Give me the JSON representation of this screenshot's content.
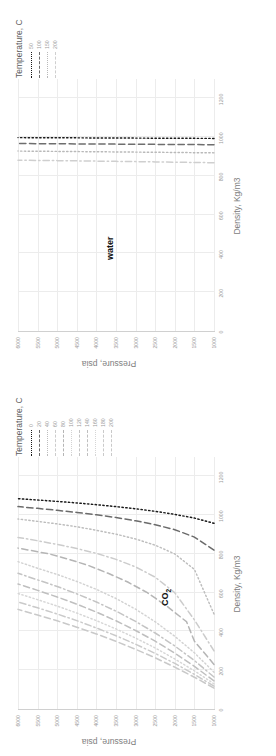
{
  "charts": [
    {
      "id": "water",
      "annotation": "water",
      "legend_title": "Temperature, C",
      "chart_data": {
        "type": "line",
        "title": "water",
        "xlabel": "Density, Kg/m3",
        "ylabel": "Pressure, psia",
        "xlim": [
          0,
          1300
        ],
        "ylim": [
          1000,
          6000
        ],
        "xticks": [
          "0",
          "200",
          "400",
          "600",
          "800",
          "1000",
          "1200"
        ],
        "yticks": [
          "1000",
          "1500",
          "2000",
          "2500",
          "3000",
          "3500",
          "4000",
          "4500",
          "5000",
          "5500",
          "6000"
        ],
        "grid": true,
        "legend_position": "top-right-outside",
        "legend_title": "Temperature, C",
        "series": [
          {
            "name": "50",
            "color": "#1a1a1a",
            "dash": "dotted",
            "points": [
              [
                993.5,
                1000
              ],
              [
                993.9,
                1500
              ],
              [
                994.3,
                2000
              ],
              [
                994.7,
                2500
              ],
              [
                995.1,
                3000
              ],
              [
                995.6,
                3500
              ],
              [
                996.0,
                4000
              ],
              [
                996.4,
                4500
              ],
              [
                996.8,
                5000
              ],
              [
                997.2,
                5500
              ],
              [
                997.6,
                6000
              ]
            ]
          },
          {
            "name": "100",
            "color": "#6e6e6e",
            "dash": "dashed",
            "points": [
              [
                961.0,
                1000
              ],
              [
                961.6,
                1500
              ],
              [
                962.2,
                2000
              ],
              [
                962.8,
                2500
              ],
              [
                963.4,
                3000
              ],
              [
                964.0,
                3500
              ],
              [
                964.6,
                4000
              ],
              [
                965.2,
                4500
              ],
              [
                965.8,
                5000
              ],
              [
                966.4,
                5500
              ],
              [
                967.0,
                6000
              ]
            ]
          },
          {
            "name": "150",
            "color": "#b9b9b9",
            "dash": "dotted",
            "points": [
              [
                919.0,
                1000
              ],
              [
                920.0,
                1500
              ],
              [
                921.0,
                2000
              ],
              [
                922.0,
                2500
              ],
              [
                922.9,
                3000
              ],
              [
                923.8,
                3500
              ],
              [
                924.7,
                4000
              ],
              [
                925.6,
                4500
              ],
              [
                926.5,
                5000
              ],
              [
                927.3,
                5500
              ],
              [
                928.1,
                6000
              ]
            ]
          },
          {
            "name": "200",
            "color": "#cfcfcf",
            "dash": "dashdot",
            "points": [
              [
                868.0,
                1000
              ],
              [
                869.5,
                1500
              ],
              [
                871.0,
                2000
              ],
              [
                872.4,
                2500
              ],
              [
                873.8,
                3000
              ],
              [
                875.1,
                3500
              ],
              [
                876.4,
                4000
              ],
              [
                877.7,
                4500
              ],
              [
                878.9,
                5000
              ],
              [
                880.1,
                5500
              ],
              [
                881.3,
                6000
              ]
            ]
          }
        ]
      }
    },
    {
      "id": "co2",
      "annotation": "CO2",
      "legend_title": "Temperature, C",
      "chart_data": {
        "type": "line",
        "title": "CO2",
        "xlabel": "Density, Kg/m3",
        "ylabel": "Pressure, psia",
        "xlim": [
          0,
          1300
        ],
        "ylim": [
          1000,
          6000
        ],
        "xticks": [
          "0",
          "200",
          "400",
          "600",
          "800",
          "1000",
          "1200"
        ],
        "yticks": [
          "1000",
          "1500",
          "2000",
          "2500",
          "3000",
          "3500",
          "4000",
          "4500",
          "5000",
          "5500",
          "6000"
        ],
        "grid": true,
        "legend_position": "top-right-outside",
        "legend_title": "Temperature, C",
        "series": [
          {
            "name": "0",
            "color": "#1a1a1a",
            "dash": "dotted",
            "points": [
              [
                958,
                1000
              ],
              [
                985,
                1500
              ],
              [
                1004,
                2000
              ],
              [
                1020,
                2500
              ],
              [
                1033,
                3000
              ],
              [
                1044,
                3500
              ],
              [
                1054,
                4000
              ],
              [
                1063,
                4500
              ],
              [
                1071,
                5000
              ],
              [
                1078,
                5500
              ],
              [
                1085,
                6000
              ]
            ]
          },
          {
            "name": "20",
            "color": "#6b6b6b",
            "dash": "dashed",
            "points": [
              [
                820,
                1000
              ],
              [
                887,
                1500
              ],
              [
                925,
                2000
              ],
              [
                951,
                2500
              ],
              [
                971,
                3000
              ],
              [
                988,
                3500
              ],
              [
                1002,
                4000
              ],
              [
                1014,
                4500
              ],
              [
                1025,
                5000
              ],
              [
                1035,
                5500
              ],
              [
                1044,
                6000
              ]
            ]
          },
          {
            "name": "40",
            "color": "#bdbdbd",
            "dash": "dotted",
            "points": [
              [
                490,
                1000
              ],
              [
                720,
                1500
              ],
              [
                800,
                2000
              ],
              [
                845,
                2500
              ],
              [
                877,
                3000
              ],
              [
                902,
                3500
              ],
              [
                922,
                4000
              ],
              [
                940,
                4500
              ],
              [
                955,
                5000
              ],
              [
                968,
                5500
              ],
              [
                980,
                6000
              ]
            ]
          },
          {
            "name": "60",
            "color": "#cccccc",
            "dash": "dashdot",
            "points": [
              [
                300,
                1000
              ],
              [
                460,
                1500
              ],
              [
                600,
                2000
              ],
              [
                680,
                2500
              ],
              [
                733,
                3000
              ],
              [
                772,
                3500
              ],
              [
                803,
                4000
              ],
              [
                828,
                4500
              ],
              [
                849,
                5000
              ],
              [
                868,
                5500
              ],
              [
                885,
                6000
              ]
            ]
          },
          {
            "name": "80",
            "color": "#b5b5b5",
            "dash": "dashed",
            "points": [
              [
                230,
                1000
              ],
              [
                350,
                1500
              ],
              [
                450,
                1700
              ],
              [
                530,
                2200
              ],
              [
                600,
                2700
              ],
              [
                655,
                3200
              ],
              [
                700,
                3700
              ],
              [
                740,
                4200
              ],
              [
                772,
                4700
              ],
              [
                800,
                5200
              ],
              [
                830,
                6000
              ]
            ]
          },
          {
            "name": "100",
            "color": "#d2d2d2",
            "dash": "dotted",
            "points": [
              [
                190,
                1000
              ],
              [
                290,
                1500
              ],
              [
                375,
                2000
              ],
              [
                450,
                2500
              ],
              [
                515,
                3000
              ],
              [
                570,
                3500
              ],
              [
                617,
                4000
              ],
              [
                658,
                4500
              ],
              [
                694,
                5000
              ],
              [
                726,
                5500
              ],
              [
                760,
                6000
              ]
            ]
          },
          {
            "name": "120",
            "color": "#c4c4c4",
            "dash": "dashdot",
            "points": [
              [
                165,
                1000
              ],
              [
                250,
                1500
              ],
              [
                325,
                2000
              ],
              [
                392,
                2500
              ],
              [
                452,
                3000
              ],
              [
                505,
                3500
              ],
              [
                552,
                4000
              ],
              [
                594,
                4500
              ],
              [
                632,
                5000
              ],
              [
                666,
                5500
              ],
              [
                700,
                6000
              ]
            ]
          },
          {
            "name": "140",
            "color": "#bfbfbf",
            "dash": "dashed",
            "points": [
              [
                145,
                1000
              ],
              [
                220,
                1500
              ],
              [
                288,
                2000
              ],
              [
                350,
                2500
              ],
              [
                405,
                3000
              ],
              [
                455,
                3500
              ],
              [
                500,
                4000
              ],
              [
                541,
                4500
              ],
              [
                578,
                5000
              ],
              [
                612,
                5500
              ],
              [
                645,
                6000
              ]
            ]
          },
          {
            "name": "160",
            "color": "#d6d6d6",
            "dash": "dotted",
            "points": [
              [
                130,
                1000
              ],
              [
                197,
                1500
              ],
              [
                258,
                2000
              ],
              [
                315,
                2500
              ],
              [
                366,
                3000
              ],
              [
                413,
                3500
              ],
              [
                456,
                4000
              ],
              [
                495,
                4500
              ],
              [
                531,
                5000
              ],
              [
                564,
                5500
              ],
              [
                596,
                6000
              ]
            ]
          },
          {
            "name": "180",
            "color": "#cacaca",
            "dash": "dashdot",
            "points": [
              [
                118,
                1000
              ],
              [
                179,
                1500
              ],
              [
                235,
                2000
              ],
              [
                287,
                2500
              ],
              [
                334,
                3000
              ],
              [
                378,
                3500
              ],
              [
                418,
                4000
              ],
              [
                456,
                4500
              ],
              [
                490,
                5000
              ],
              [
                522,
                5500
              ],
              [
                552,
                6000
              ]
            ]
          },
          {
            "name": "200",
            "color": "#c9c9c9",
            "dash": "dashed",
            "points": [
              [
                108,
                1000
              ],
              [
                164,
                1500
              ],
              [
                216,
                2000
              ],
              [
                264,
                2500
              ],
              [
                308,
                3000
              ],
              [
                349,
                3500
              ],
              [
                387,
                4000
              ],
              [
                422,
                4500
              ],
              [
                455,
                5000
              ],
              [
                485,
                5500
              ],
              [
                514,
                6000
              ]
            ]
          }
        ]
      }
    }
  ]
}
